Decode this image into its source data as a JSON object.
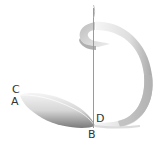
{
  "diagram": {
    "type": "twisted-ribbon-strip",
    "colors": {
      "background": "#ffffff",
      "ribbon_light": "#f2f2f2",
      "ribbon_mid": "#cfcfcf",
      "ribbon_dark": "#8a8a8a",
      "axis": "#9a9a9a",
      "label": "#333333"
    },
    "labels": {
      "C": "C",
      "A": "A",
      "D": "D",
      "B": "B"
    }
  }
}
